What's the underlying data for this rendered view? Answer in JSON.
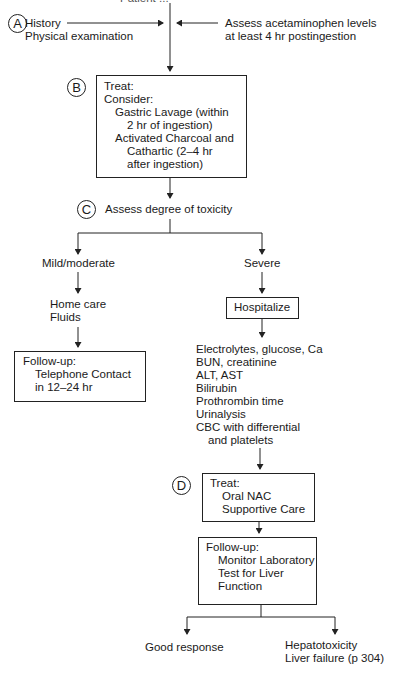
{
  "top_cut_text": "Patient ...",
  "step_a": {
    "marker": "A",
    "left_lines": [
      "History",
      "Physical examination"
    ],
    "right_lines": [
      "Assess acetaminophen levels",
      "at least 4 hr postingestion"
    ]
  },
  "step_b": {
    "marker": "B",
    "lines": [
      "Treat:",
      "Consider:",
      "Gastric Lavage (within",
      "2 hr of ingestion)",
      "Activated Charcoal and",
      "Cathartic (2–4 hr",
      "after ingestion)"
    ]
  },
  "step_c": {
    "marker": "C",
    "label": "Assess degree of toxicity"
  },
  "mild_branch": {
    "label": "Mild/moderate",
    "care_lines": [
      "Home care",
      "Fluids"
    ],
    "followup_lines": [
      "Follow-up:",
      "Telephone Contact",
      "in 12–24 hr"
    ]
  },
  "severe_branch": {
    "label": "Severe",
    "hospitalize": "Hospitalize",
    "labs": [
      "Electrolytes, glucose, Ca",
      "BUN, creatinine",
      "ALT, AST",
      "Bilirubin",
      "Prothrombin time",
      "Urinalysis",
      "CBC with differential",
      "and platelets"
    ]
  },
  "step_d": {
    "marker": "D",
    "treat_lines": [
      "Treat:",
      "Oral NAC",
      "Supportive Care"
    ],
    "followup_lines": [
      "Follow-up:",
      "Monitor Laboratory",
      "Test for Liver",
      "Function"
    ]
  },
  "outcomes": {
    "good": "Good response",
    "bad_lines": [
      "Hepatotoxicity",
      "Liver failure (p 304)"
    ]
  }
}
